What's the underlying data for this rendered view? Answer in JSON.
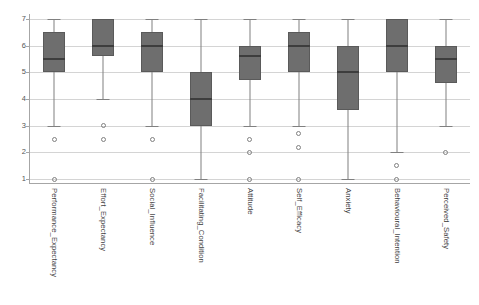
{
  "chart_data": {
    "type": "box",
    "title": "",
    "xlabel": "",
    "ylabel": "",
    "ylim": [
      1,
      7
    ],
    "yticks": [
      1,
      2,
      3,
      4,
      5,
      6,
      7
    ],
    "ytick_labels": [
      "1",
      "2",
      "3",
      "4",
      "5",
      "6",
      "7"
    ],
    "grid": true,
    "legend": "none",
    "box_fill_color": "#6e6e6e",
    "box_edge_color": "#5a5a5a",
    "median_color": "#3d3d3d",
    "whisker_color": "#808080",
    "gridline_color": "#d4d4d4",
    "axis_color": "#a6a6a6",
    "background_color": "#ffffff",
    "categories": [
      "Performance_Expectancy",
      "Effort_Expectancy",
      "Social_Influence",
      "Facilitating_Condition",
      "Attitude",
      "Self_Efficacy",
      "Anxiety",
      "Behavioural_Intention",
      "Perceived_Safety"
    ],
    "boxes": [
      {
        "label": "Performance_Expectancy",
        "whisker_low": 3.0,
        "q1": 5.0,
        "median": 5.5,
        "q3": 6.5,
        "whisker_high": 7.0,
        "outliers": [
          2.5,
          1.0
        ]
      },
      {
        "label": "Effort_Expectancy",
        "whisker_low": 4.0,
        "q1": 5.6,
        "median": 6.0,
        "q3": 7.0,
        "whisker_high": 7.0,
        "outliers": [
          3.0,
          2.5
        ]
      },
      {
        "label": "Social_Influence",
        "whisker_low": 3.0,
        "q1": 5.0,
        "median": 6.0,
        "q3": 6.5,
        "whisker_high": 7.0,
        "outliers": [
          2.5,
          1.0
        ]
      },
      {
        "label": "Facilitating_Condition",
        "whisker_low": 1.0,
        "q1": 3.0,
        "median": 4.0,
        "q3": 5.0,
        "whisker_high": 7.0,
        "outliers": []
      },
      {
        "label": "Attitude",
        "whisker_low": 3.0,
        "q1": 4.7,
        "median": 5.6,
        "q3": 6.0,
        "whisker_high": 7.0,
        "outliers": [
          2.5,
          2.0,
          1.0
        ]
      },
      {
        "label": "Self_Efficacy",
        "whisker_low": 3.0,
        "q1": 5.0,
        "median": 6.0,
        "q3": 6.5,
        "whisker_high": 7.0,
        "outliers": [
          2.7,
          2.2,
          1.0
        ]
      },
      {
        "label": "Anxiety",
        "whisker_low": 1.0,
        "q1": 3.6,
        "median": 5.0,
        "q3": 6.0,
        "whisker_high": 7.0,
        "outliers": []
      },
      {
        "label": "Behavioural_Intention",
        "whisker_low": 2.0,
        "q1": 5.0,
        "median": 6.0,
        "q3": 7.0,
        "whisker_high": 7.0,
        "outliers": [
          1.5,
          1.0
        ]
      },
      {
        "label": "Perceived_Safety",
        "whisker_low": 3.0,
        "q1": 4.6,
        "median": 5.5,
        "q3": 6.0,
        "whisker_high": 7.0,
        "outliers": [
          2.0
        ]
      }
    ]
  }
}
